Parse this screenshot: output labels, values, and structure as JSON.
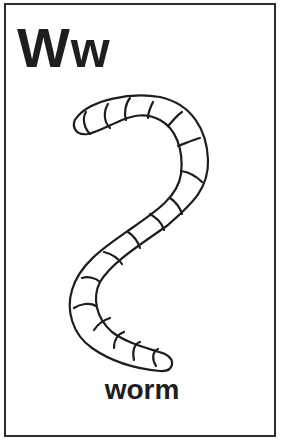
{
  "card": {
    "uppercase_letter": "W",
    "lowercase_letter": "w",
    "word": "worm",
    "illustration": "worm-outline-drawing"
  },
  "colors": {
    "ink": "#1e1e1e",
    "border": "#2b2b2b",
    "background": "#ffffff"
  }
}
